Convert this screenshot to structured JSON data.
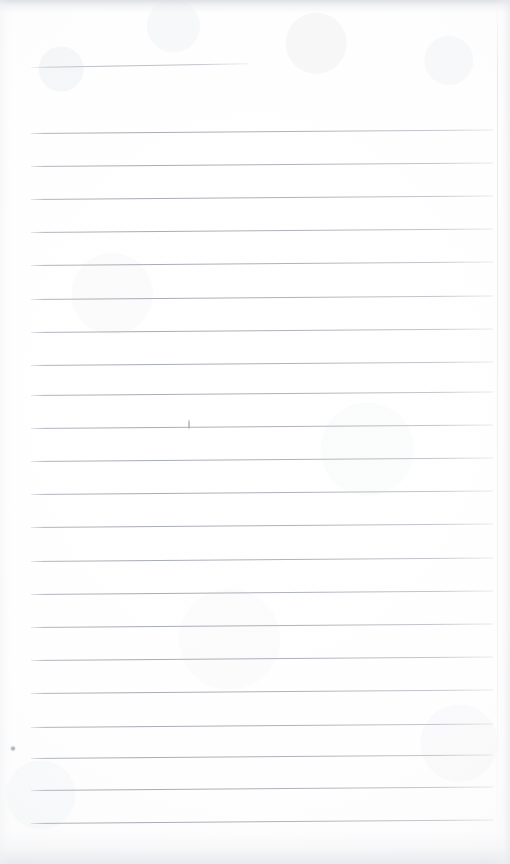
{
  "document": {
    "kind": "scanned-ruled-notepad-page",
    "title": "Blank lined notepad page (scan)",
    "content_text": "",
    "handwriting_present": "none",
    "page_width": 510,
    "page_height": 864
  },
  "paper": {
    "background_color": "#ffffff",
    "tint_color": "#fbfbfc",
    "edge_shadow_color": "#d6d8dc"
  },
  "ruling": {
    "line_color": "#a8acb3",
    "line_thickness_px": 1,
    "line_spacing_px": 33.2,
    "skew_degrees": -0.42,
    "left_margin_px": 31,
    "right_end_px": 493,
    "count": 22,
    "lines": [
      {
        "label": "rule-1",
        "x": 31,
        "y": 132.5,
        "width": 462
      },
      {
        "label": "rule-2",
        "x": 31,
        "y": 165.7,
        "width": 462
      },
      {
        "label": "rule-3",
        "x": 31,
        "y": 198.9,
        "width": 462
      },
      {
        "label": "rule-4",
        "x": 31,
        "y": 232.1,
        "width": 462
      },
      {
        "label": "rule-5",
        "x": 31,
        "y": 265.3,
        "width": 462
      },
      {
        "label": "rule-6",
        "x": 31,
        "y": 298.5,
        "width": 462
      },
      {
        "label": "rule-7",
        "x": 31,
        "y": 331.7,
        "width": 462
      },
      {
        "label": "rule-8",
        "x": 31,
        "y": 364.9,
        "width": 462
      },
      {
        "label": "rule-9",
        "x": 31,
        "y": 394.5,
        "width": 462
      },
      {
        "label": "rule-10",
        "x": 31,
        "y": 427.7,
        "width": 462
      },
      {
        "label": "rule-11",
        "x": 31,
        "y": 460.9,
        "width": 462
      },
      {
        "label": "rule-12",
        "x": 31,
        "y": 494.1,
        "width": 462
      },
      {
        "label": "rule-13",
        "x": 31,
        "y": 527.3,
        "width": 462
      },
      {
        "label": "rule-14",
        "x": 31,
        "y": 560.5,
        "width": 462
      },
      {
        "label": "rule-15",
        "x": 31,
        "y": 593.7,
        "width": 462
      },
      {
        "label": "rule-16",
        "x": 31,
        "y": 626.9,
        "width": 462
      },
      {
        "label": "rule-17",
        "x": 31,
        "y": 660.1,
        "width": 462
      },
      {
        "label": "rule-18",
        "x": 31,
        "y": 693.3,
        "width": 462
      },
      {
        "label": "rule-19",
        "x": 31,
        "y": 726.5,
        "width": 462
      },
      {
        "label": "rule-20",
        "x": 31,
        "y": 757.5,
        "width": 462
      },
      {
        "label": "rule-21",
        "x": 31,
        "y": 790.2,
        "width": 462
      },
      {
        "label": "rule-22",
        "x": 31,
        "y": 822.9,
        "width": 462
      }
    ],
    "header_rule": {
      "label": "header-rule",
      "x": 31,
      "y": 67,
      "width": 217
    }
  },
  "artifacts": [
    {
      "label": "speck-bottom-left",
      "x": 10,
      "y": 745,
      "size": 6
    },
    {
      "label": "tick-mark",
      "x": 188,
      "y": 419,
      "size": 11
    }
  ]
}
